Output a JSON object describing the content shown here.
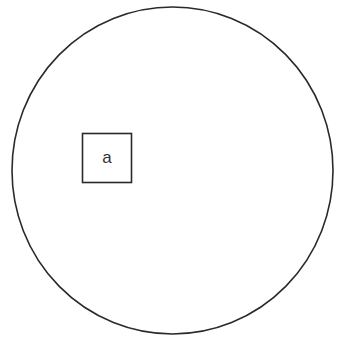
{
  "diagram": {
    "type": "venn-like",
    "background": "#ffffff",
    "stroke_color": "#2a2a2a",
    "circle": {
      "cx": 172.5,
      "cy": 170.5,
      "rx": 160.5,
      "ry": 163.5
    },
    "box": {
      "x": 82,
      "y": 133,
      "width": 50,
      "height": 50,
      "label": "a"
    }
  }
}
